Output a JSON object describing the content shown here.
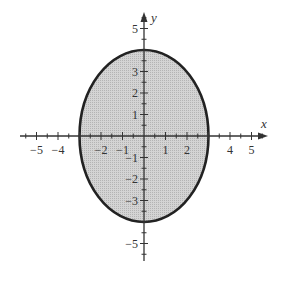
{
  "chart_data": {
    "type": "area",
    "title": "",
    "xlabel": "x",
    "ylabel": "y",
    "xlim": [
      -5.5,
      5.6
    ],
    "ylim": [
      -5.8,
      5.8
    ],
    "grid": false,
    "series": [
      {
        "name": "ellipse",
        "shape": "ellipse",
        "center": [
          0,
          0
        ],
        "semi_axis_x": 3,
        "semi_axis_y": 4,
        "equation": "x^2/9 + y^2/16 = 1",
        "fill": "#c8c8c8",
        "stroke": "#222222",
        "filled_region": "interior"
      }
    ],
    "x_tick_labels": [
      "-5",
      "-4",
      "-2",
      "-1",
      "1",
      "2",
      "4",
      "5"
    ],
    "y_tick_labels": [
      "5",
      "3",
      "2",
      "1",
      "-1",
      "-2",
      "-3",
      "-5"
    ],
    "minor_ticks_step": 0.5
  },
  "colors": {
    "fill": "#c8c8c8",
    "stroke": "#222222",
    "axis": "#333333"
  }
}
